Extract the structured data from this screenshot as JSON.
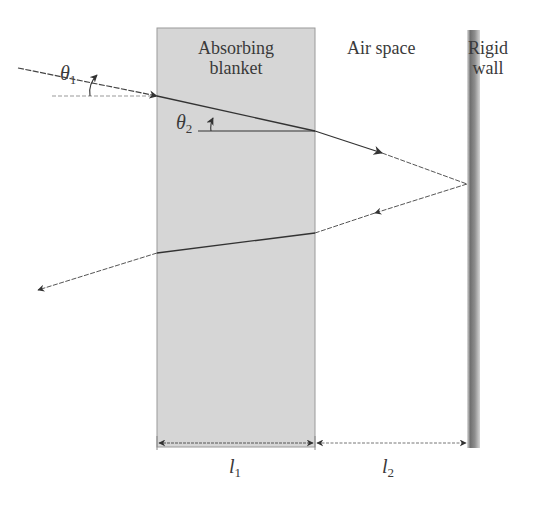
{
  "diagram": {
    "type": "acoustic ray path through absorbing blanket with air space and rigid wall",
    "regions": {
      "blanket": {
        "label_line1": "Absorbing",
        "label_line2": "blanket",
        "fill": "#d6d6d6"
      },
      "air": {
        "label": "Air space"
      },
      "wall": {
        "label_line1": "Rigid",
        "label_line2": "wall",
        "fill": "#8a8a8a"
      }
    },
    "angles": {
      "theta1": {
        "symbol": "θ",
        "sub": "1"
      },
      "theta2": {
        "symbol": "θ",
        "sub": "2"
      }
    },
    "dimensions": {
      "l1": {
        "symbol": "l",
        "sub": "1"
      },
      "l2": {
        "symbol": "l",
        "sub": "2"
      }
    },
    "colors": {
      "line": "#444444",
      "text": "#3a3a3a"
    }
  }
}
